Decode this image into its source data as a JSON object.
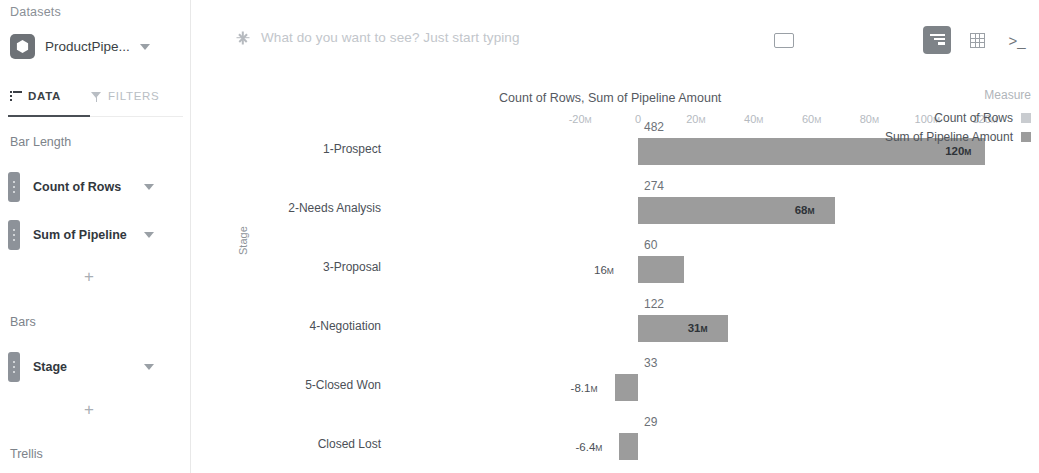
{
  "sidebar": {
    "datasets_label": "Datasets",
    "dataset": {
      "name": "ProductPipe...",
      "icon": "dataset-hexagon-icon"
    },
    "tabs": [
      {
        "label": "DATA",
        "icon": "list-icon",
        "active": true
      },
      {
        "label": "FILTERS",
        "icon": "funnel-icon",
        "active": false
      }
    ],
    "groups": [
      {
        "title": "Bar Length",
        "fields": [
          {
            "label": "Count of Rows"
          },
          {
            "label": "Sum of Pipeline"
          }
        ],
        "add_label": "+"
      },
      {
        "title": "Bars",
        "fields": [
          {
            "label": "Stage"
          }
        ],
        "add_label": "+"
      },
      {
        "title": "Trellis",
        "fields": []
      }
    ]
  },
  "topbar": {
    "search_placeholder": "What do you want to see? Just start typing",
    "search_value": "",
    "sparkle_icon": "sparkle-icon",
    "go_button": "play-icon",
    "view_buttons": [
      {
        "name": "chart-view-icon",
        "active": true
      },
      {
        "name": "table-view-icon",
        "active": false
      },
      {
        "name": "console-icon",
        "active": false,
        "glyph": ">_"
      }
    ]
  },
  "legend": {
    "title": "Measure",
    "items": [
      {
        "label": "Count of Rows",
        "color": "#c9ccd0"
      },
      {
        "label": "Sum of Pipeline Amount",
        "color": "#9c9c9c"
      }
    ]
  },
  "chart_data": {
    "type": "bar",
    "title": "Count of Rows, Sum of Pipeline Amount",
    "xlabel": "",
    "ylabel": "Stage",
    "orientation": "horizontal",
    "xlim": [
      -20000000,
      130000000
    ],
    "grid": false,
    "legend_position": "right",
    "tick_labels": [
      "-20M",
      "0",
      "20M",
      "40M",
      "60M",
      "80M",
      "100M",
      "120M"
    ],
    "tick_values": [
      -20000000,
      0,
      20000000,
      40000000,
      60000000,
      80000000,
      100000000,
      120000000
    ],
    "categories": [
      "1-Prospect",
      "2-Needs Analysis",
      "3-Proposal",
      "4-Negotiation",
      "5-Closed Won",
      "Closed Lost"
    ],
    "series": [
      {
        "name": "Count of Rows",
        "values": [
          482,
          274,
          60,
          122,
          33,
          29
        ],
        "labels": [
          "482",
          "274",
          "60",
          "122",
          "33",
          "29"
        ]
      },
      {
        "name": "Sum of Pipeline Amount",
        "values": [
          120000000,
          68000000,
          16000000,
          31000000,
          -8100000,
          -6400000
        ],
        "labels": [
          "120M",
          "68M",
          "16M",
          "31M",
          "-8.1M",
          "-6.4M"
        ]
      }
    ]
  }
}
